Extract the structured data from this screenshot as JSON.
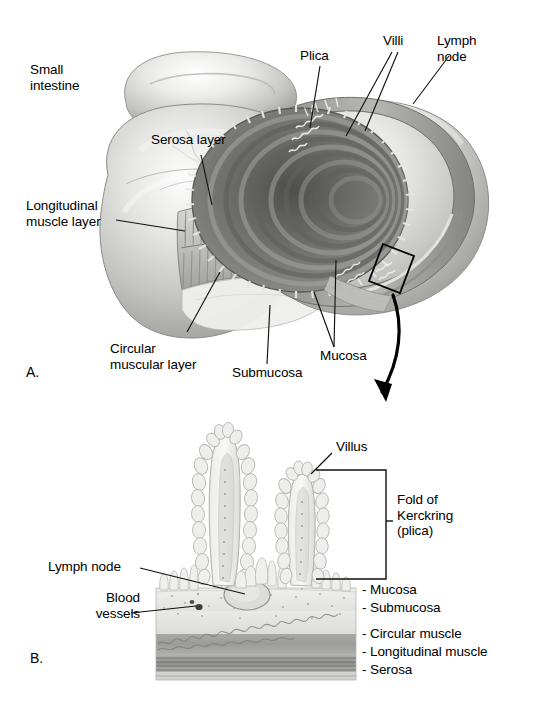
{
  "figure": {
    "background_color": "#ffffff",
    "ink_color": "#000000"
  },
  "panels": [
    {
      "id": "A",
      "letter": "A.",
      "caption": "Cut-away view of small intestine showing wall layers",
      "labels": [
        {
          "name": "small-intestine",
          "text": "Small\nintestine",
          "x": 30,
          "y": 68
        },
        {
          "name": "serosa-layer",
          "text": "Serosa layer",
          "x": 151,
          "y": 138
        },
        {
          "name": "longitudinal-muscle-layer",
          "text": "Longitudinal\nmuscle layer",
          "x": 30,
          "y": 203
        },
        {
          "name": "circular-muscular-layer",
          "text": "Circular\nmuscular layer",
          "x": 113,
          "y": 349
        },
        {
          "name": "submucosa",
          "text": "Submucosa",
          "x": 235,
          "y": 372
        },
        {
          "name": "mucosa",
          "text": "Mucosa",
          "x": 323,
          "y": 355
        },
        {
          "name": "plica",
          "text": "Plica",
          "x": 299,
          "y": 52
        },
        {
          "name": "villi",
          "text": "Villi",
          "x": 383,
          "y": 37
        },
        {
          "name": "lymph-node",
          "text": "Lymph\nnode",
          "x": 437,
          "y": 37
        }
      ]
    },
    {
      "id": "B",
      "letter": "B.",
      "caption": "Magnified cross-section of the intestinal wall",
      "labels": [
        {
          "name": "villus",
          "text": "Villus",
          "x": 336,
          "y": 445
        },
        {
          "name": "fold-of-kerckring",
          "text": "Fold of\nKerckring\n(plica)",
          "x": 396,
          "y": 498
        },
        {
          "name": "lymph-node",
          "text": "Lymph node",
          "x": 48,
          "y": 563
        },
        {
          "name": "blood-vessels",
          "text": "Blood\nvessels",
          "x": 70,
          "y": 595
        },
        {
          "name": "mucosa",
          "text": "- Mucosa",
          "x": 362,
          "y": 588
        },
        {
          "name": "submucosa",
          "text": "- Submucosa",
          "x": 362,
          "y": 606
        },
        {
          "name": "circular-muscle",
          "text": "- Circular muscle",
          "x": 362,
          "y": 632
        },
        {
          "name": "longitudinal-muscle",
          "text": "- Longitudinal muscle",
          "x": 362,
          "y": 650
        },
        {
          "name": "serosa",
          "text": "- Serosa",
          "x": 362,
          "y": 668
        }
      ]
    }
  ],
  "colors": {
    "tissue_light": "#e8e8e6",
    "tissue_mid": "#c9c9c6",
    "tissue_dark": "#9b9b98",
    "lumen_dark": "#6e6e6b",
    "outline": "#6d6d6a",
    "muscle_band": "#9a9a97",
    "ink": "#111111"
  },
  "annotations": {
    "callout_box": "magnification-region",
    "callout_arrow": "curved-arrow-to-panel-b"
  }
}
